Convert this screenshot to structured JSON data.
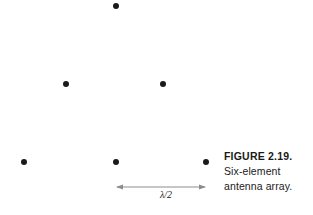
{
  "figure": {
    "caption_lines": [
      {
        "text": "FIGURE 2.19.",
        "bold": true
      },
      {
        "text": "Six-element",
        "bold": false
      },
      {
        "text": "antenna array.",
        "bold": false
      }
    ],
    "caption_label": "FIGURE 2.19.",
    "caption_line2": "Six-element",
    "caption_line3": "antenna array.",
    "dimension_label": "λ/2",
    "colors": {
      "element_fill": "#1a1a1a",
      "dimension_line": "#8c8c8c",
      "caption_text": "#1a1a1a",
      "background": "#ffffff"
    },
    "element_count": 6,
    "elements": [
      {
        "name": "antenna-element-1",
        "x": 116,
        "y": 6,
        "row": "top"
      },
      {
        "name": "antenna-element-2",
        "x": 66,
        "y": 84,
        "row": "middle"
      },
      {
        "name": "antenna-element-3",
        "x": 163,
        "y": 84,
        "row": "middle"
      },
      {
        "name": "antenna-element-4",
        "x": 24,
        "y": 162,
        "row": "bottom"
      },
      {
        "name": "antenna-element-5",
        "x": 116,
        "y": 162,
        "row": "bottom"
      },
      {
        "name": "antenna-element-6",
        "x": 206,
        "y": 162,
        "row": "bottom"
      }
    ],
    "dimension": {
      "from_x": 116,
      "to_x": 206,
      "y": 187,
      "spans_elements": [
        "antenna-element-5",
        "antenna-element-6"
      ]
    }
  }
}
